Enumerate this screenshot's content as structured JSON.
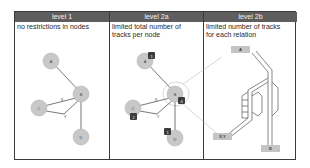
{
  "panels": [
    {
      "header": "level 1",
      "description": "no restrictions in nodes",
      "nodes": [
        {
          "label": "A",
          "x": 41,
          "y": 50
        },
        {
          "label": "B",
          "x": 68,
          "y": 81
        },
        {
          "label": "C",
          "x": 26,
          "y": 99
        },
        {
          "label": "D",
          "x": 68,
          "y": 127
        }
      ],
      "edges": [
        {
          "from": "A",
          "to": "B"
        },
        {
          "from": "C",
          "to": "B",
          "label": "X"
        },
        {
          "from": "C",
          "to": "B",
          "label": "Y",
          "via": "bend"
        },
        {
          "from": "B",
          "to": "D"
        }
      ]
    },
    {
      "header": "level 2a",
      "description_lines": [
        "limited total number of",
        "tracks per node"
      ],
      "nodes": [
        {
          "label": "A",
          "badge": "1"
        },
        {
          "label": "B",
          "badge": "4"
        },
        {
          "label": "C",
          "badge": "2"
        },
        {
          "label": "D",
          "badge": "1"
        }
      ],
      "edge_labels": [
        "X",
        "Y"
      ]
    },
    {
      "header": "level 2b",
      "description_lines": [
        "limited number of tracks",
        "for each relation"
      ],
      "boxes": [
        "A",
        "X,Y",
        "D"
      ]
    }
  ],
  "colors": {
    "header_bg": "#5e5e5e",
    "node_fill": "#c8c8c8",
    "badge_fill": "#3c3c3c",
    "box_fill": "#c4c4c4",
    "line": "#555555",
    "zoom_line": "#bdbdbd"
  }
}
